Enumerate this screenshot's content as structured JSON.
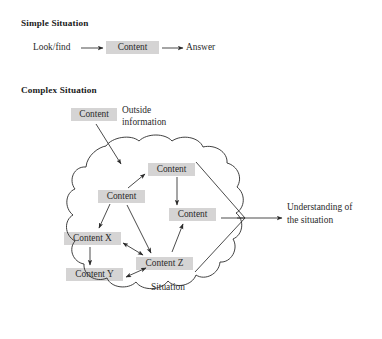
{
  "figure": {
    "sections": [
      {
        "id": "simple",
        "heading": "Simple Situation"
      },
      {
        "id": "complex",
        "heading": "Complex Situation"
      }
    ],
    "simple_flow": {
      "source_label": "Look/find",
      "content_label": "Content",
      "result_label": "Answer"
    },
    "complex_flow": {
      "outside_content_label": "Content",
      "outside_information_label": "Outside\ninformation",
      "outside_information_line1": "Outside",
      "outside_information_line2": "information",
      "situation_label": "Situation",
      "outcome_line1": "Understanding of",
      "outcome_line2": "the situation",
      "nodes": [
        {
          "id": "top-right",
          "label": "Content"
        },
        {
          "id": "middle-left",
          "label": "Content"
        },
        {
          "id": "mid-right",
          "label": "Content"
        },
        {
          "id": "content-x",
          "label": "Content X"
        },
        {
          "id": "content-y",
          "label": "Content Y"
        },
        {
          "id": "content-z",
          "label": "Content Z"
        }
      ]
    },
    "colors": {
      "box_fill": "#d5d4d4",
      "ink": "#2b2b2b",
      "background": "#ffffff"
    }
  }
}
